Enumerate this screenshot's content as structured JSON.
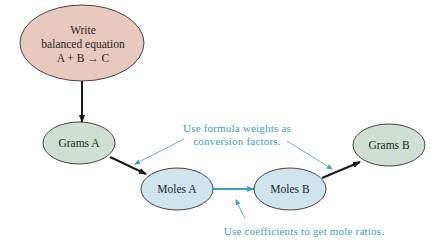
{
  "diagram": {
    "nodes": {
      "equation": {
        "lines": [
          "Write",
          "balanced equation",
          "A + B → C"
        ],
        "fill": "#e8c9bd"
      },
      "grams_a": {
        "label": "Grams A",
        "fill": "#cfe0d2"
      },
      "moles_a": {
        "label": "Moles A",
        "fill": "#cfe5ee"
      },
      "moles_b": {
        "label": "Moles B",
        "fill": "#cfe5ee"
      },
      "grams_b": {
        "label": "Grams B",
        "fill": "#cfe0d2"
      }
    },
    "notes": {
      "formula_weights": [
        "Use formula weights as",
        "conversion factors."
      ],
      "coefficients": "Use coefficients to get mole ratios."
    },
    "colors": {
      "arrow": "#1a1a1a",
      "accent": "#3aa3c8",
      "note": "#3aa3b5",
      "outline": "#333333"
    }
  }
}
